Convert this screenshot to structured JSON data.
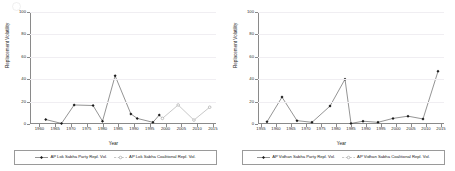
{
  "axes": {
    "ylabel": "Replacement Volatility",
    "xlabel": "Year",
    "yticks": [
      0,
      20,
      40,
      60,
      80,
      100
    ],
    "ylim": [
      0,
      100
    ],
    "grid": "horizontal-faint"
  },
  "chart_data": [
    {
      "type": "line",
      "panel": "left",
      "title": "",
      "xlabel": "Year",
      "ylabel": "Replacement Volatility",
      "xlim": [
        1957,
        2016
      ],
      "ylim": [
        0,
        100
      ],
      "xticks": [
        1960,
        1965,
        1970,
        1975,
        1980,
        1985,
        1990,
        1995,
        2000,
        2005,
        2010,
        2015
      ],
      "yticks": [
        0,
        20,
        40,
        60,
        80,
        100
      ],
      "grid": true,
      "legend_position": "bottom",
      "series": [
        {
          "name": "AP Lok Sabha Party Repl. Vol.",
          "marker": "solid-diamond",
          "x": [
            1962,
            1967,
            1971,
            1977,
            1980,
            1984,
            1989,
            1991,
            1996,
            1998
          ],
          "y": [
            4,
            0.5,
            17,
            16.5,
            2.5,
            43,
            9,
            5,
            1.5,
            8
          ]
        },
        {
          "name": "AP Lok Sabha Coalitional Repl. Vol.",
          "marker": "hollow-circle",
          "x": [
            1999,
            2004,
            2009,
            2014
          ],
          "y": [
            5,
            17,
            3.5,
            15
          ]
        }
      ]
    },
    {
      "type": "line",
      "panel": "right",
      "title": "",
      "xlabel": "Year",
      "ylabel": "Replacement Volatility",
      "xlim": [
        1954,
        2016
      ],
      "ylim": [
        0,
        100
      ],
      "xticks": [
        1955,
        1960,
        1965,
        1970,
        1975,
        1980,
        1985,
        1990,
        1995,
        2000,
        2005,
        2010,
        2015
      ],
      "yticks": [
        0,
        20,
        40,
        60,
        80,
        100
      ],
      "grid": true,
      "legend_position": "bottom",
      "series": [
        {
          "name": "AP Vidhan Sabha Party Repl. Vol.",
          "marker": "solid-diamond",
          "x": [
            1957,
            1962,
            1967,
            1972,
            1978,
            1983,
            1985,
            1989,
            1994,
            1999,
            2004,
            2009,
            2014
          ],
          "y": [
            2,
            24,
            3,
            1.5,
            16,
            40,
            0.5,
            2.5,
            1.5,
            5,
            7,
            4.5,
            47
          ]
        },
        {
          "name": "AP Vidhan Sabha Coalitional Repl. Vol.",
          "marker": "hollow-circle",
          "x": [],
          "y": []
        }
      ]
    }
  ],
  "panels": [
    {
      "legend": [
        {
          "label": "AP Lok Sabha Party Repl. Vol.",
          "marker": "solid-diamond"
        },
        {
          "label": "AP Lok Sabha Coalitional Repl. Vol.",
          "marker": "hollow-circle"
        }
      ]
    },
    {
      "legend": [
        {
          "label": "AP Vidhan Sabha Party Repl. Vol.",
          "marker": "solid-diamond"
        },
        {
          "label": "AP Vidhan Sabha Coalitional Repl. Vol.",
          "marker": "hollow-circle"
        }
      ]
    }
  ],
  "colors": {
    "series_primary": "#1a1a1a",
    "series_secondary": "#9a9a9a",
    "axis": "#8a8a8a",
    "grid": "#f0eef2",
    "background": "#ffffff"
  }
}
